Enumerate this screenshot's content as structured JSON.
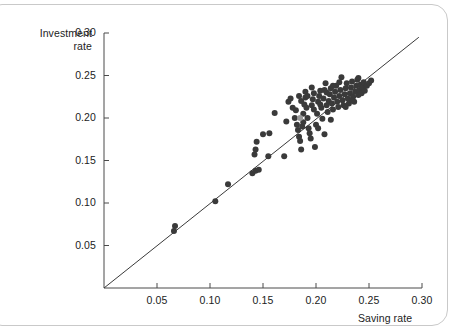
{
  "figure": {
    "caption_alt": "",
    "background": "#ffffff",
    "frame_color": "#c9c9c9"
  },
  "chart_data": {
    "type": "scatter",
    "title": "",
    "xlabel": "Saving rate",
    "ylabel": "Investment\nrate",
    "ylabel_line1": "Investment",
    "ylabel_line2": "rate",
    "xlim": [
      0,
      0.3
    ],
    "ylim": [
      0,
      0.3
    ],
    "xticks": [
      0.05,
      0.1,
      0.15,
      0.2,
      0.25,
      0.3
    ],
    "yticks": [
      0.05,
      0.1,
      0.15,
      0.2,
      0.25,
      0.3
    ],
    "xtick_labels": [
      "0.05",
      "0.10",
      "0.15",
      "0.20",
      "0.25",
      "0.30"
    ],
    "ytick_labels": [
      "0.05",
      "0.10",
      "0.15",
      "0.20",
      "0.25",
      "0.30"
    ],
    "grid": false,
    "legend": null,
    "marker": {
      "shape": "circle",
      "color": "#3a3a3a",
      "highlight_color": "#9a9a9a",
      "size_px": 6
    },
    "reference_line": {
      "label": "45-degree line",
      "from": [
        0.0,
        0.0
      ],
      "to": [
        0.297,
        0.295
      ],
      "color": "#3a3a3a",
      "width_px": 1
    },
    "points": [
      [
        0.066,
        0.067
      ],
      [
        0.067,
        0.073
      ],
      [
        0.105,
        0.102
      ],
      [
        0.117,
        0.122
      ],
      [
        0.14,
        0.135
      ],
      [
        0.143,
        0.138
      ],
      [
        0.146,
        0.139
      ],
      [
        0.142,
        0.157
      ],
      [
        0.143,
        0.163
      ],
      [
        0.144,
        0.172
      ],
      [
        0.15,
        0.181
      ],
      [
        0.156,
        0.182
      ],
      [
        0.155,
        0.155
      ],
      [
        0.161,
        0.206
      ],
      [
        0.17,
        0.155
      ],
      [
        0.174,
        0.219
      ],
      [
        0.176,
        0.223
      ],
      [
        0.18,
        0.2
      ],
      [
        0.181,
        0.209
      ],
      [
        0.182,
        0.192
      ],
      [
        0.183,
        0.186
      ],
      [
        0.184,
        0.178
      ],
      [
        0.185,
        0.173
      ],
      [
        0.186,
        0.163
      ],
      [
        0.187,
        0.19
      ],
      [
        0.188,
        0.195
      ],
      [
        0.188,
        0.205
      ],
      [
        0.189,
        0.216
      ],
      [
        0.19,
        0.224
      ],
      [
        0.19,
        0.231
      ],
      [
        0.191,
        0.212
      ],
      [
        0.192,
        0.2
      ],
      [
        0.193,
        0.188
      ],
      [
        0.194,
        0.182
      ],
      [
        0.195,
        0.176
      ],
      [
        0.196,
        0.215
      ],
      [
        0.197,
        0.222
      ],
      [
        0.198,
        0.229
      ],
      [
        0.199,
        0.166
      ],
      [
        0.2,
        0.192
      ],
      [
        0.201,
        0.205
      ],
      [
        0.202,
        0.219
      ],
      [
        0.203,
        0.226
      ],
      [
        0.204,
        0.232
      ],
      [
        0.205,
        0.212
      ],
      [
        0.206,
        0.199
      ],
      [
        0.207,
        0.223
      ],
      [
        0.208,
        0.233
      ],
      [
        0.209,
        0.241
      ],
      [
        0.21,
        0.215
      ],
      [
        0.211,
        0.207
      ],
      [
        0.212,
        0.22
      ],
      [
        0.213,
        0.228
      ],
      [
        0.214,
        0.235
      ],
      [
        0.215,
        0.217
      ],
      [
        0.216,
        0.21
      ],
      [
        0.217,
        0.224
      ],
      [
        0.218,
        0.231
      ],
      [
        0.219,
        0.238
      ],
      [
        0.22,
        0.219
      ],
      [
        0.221,
        0.213
      ],
      [
        0.222,
        0.226
      ],
      [
        0.223,
        0.233
      ],
      [
        0.224,
        0.248
      ],
      [
        0.225,
        0.221
      ],
      [
        0.226,
        0.215
      ],
      [
        0.227,
        0.228
      ],
      [
        0.228,
        0.235
      ],
      [
        0.229,
        0.241
      ],
      [
        0.23,
        0.223
      ],
      [
        0.231,
        0.217
      ],
      [
        0.232,
        0.229
      ],
      [
        0.233,
        0.236
      ],
      [
        0.234,
        0.243
      ],
      [
        0.235,
        0.225
      ],
      [
        0.236,
        0.219
      ],
      [
        0.237,
        0.231
      ],
      [
        0.238,
        0.238
      ],
      [
        0.239,
        0.245
      ],
      [
        0.24,
        0.227
      ],
      [
        0.241,
        0.233
      ],
      [
        0.242,
        0.239
      ],
      [
        0.243,
        0.229
      ],
      [
        0.244,
        0.236
      ],
      [
        0.245,
        0.242
      ],
      [
        0.246,
        0.232
      ],
      [
        0.248,
        0.238
      ],
      [
        0.25,
        0.241
      ],
      [
        0.252,
        0.244
      ],
      [
        0.184,
        0.226
      ],
      [
        0.178,
        0.212
      ],
      [
        0.172,
        0.196
      ],
      [
        0.196,
        0.236
      ],
      [
        0.202,
        0.188
      ],
      [
        0.208,
        0.181
      ],
      [
        0.214,
        0.198
      ],
      [
        0.186,
        0.22
      ],
      [
        0.192,
        0.226
      ],
      [
        0.198,
        0.21
      ],
      [
        0.204,
        0.216
      ],
      [
        0.21,
        0.23
      ],
      [
        0.216,
        0.238
      ],
      [
        0.222,
        0.242
      ],
      [
        0.228,
        0.213
      ],
      [
        0.234,
        0.221
      ],
      [
        0.24,
        0.247
      ]
    ],
    "highlight_points": [
      [
        0.185,
        0.2
      ]
    ],
    "n_points": 107
  }
}
